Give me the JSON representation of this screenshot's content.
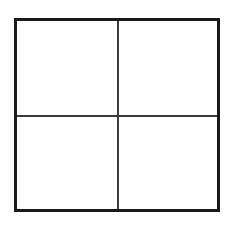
{
  "figure": {
    "type": "four-quadrant-grid",
    "title": "",
    "caption": "",
    "background_color": "#ffffff",
    "border_color": "#1a1a1a",
    "divider_color": "#3a3a3a",
    "border_width_px": 3,
    "divider_width_px": 1.5,
    "columns": 2,
    "rows": 2
  },
  "quadrants": [
    {
      "id": "top-left",
      "label": "",
      "content": ""
    },
    {
      "id": "top-right",
      "label": "",
      "content": ""
    },
    {
      "id": "bottom-left",
      "label": "",
      "content": ""
    },
    {
      "id": "bottom-right",
      "label": "",
      "content": ""
    }
  ]
}
